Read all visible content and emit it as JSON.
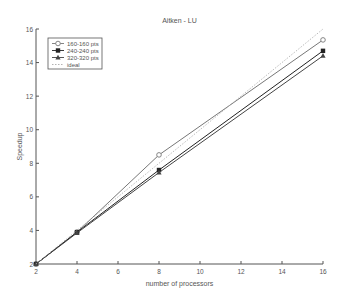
{
  "chart_data": {
    "type": "line",
    "title": "Aitken - LU",
    "xlabel": "number of processors",
    "ylabel": "Speedup",
    "xlim": [
      2,
      16
    ],
    "ylim": [
      2,
      16
    ],
    "xticks": [
      2,
      4,
      6,
      8,
      10,
      12,
      14,
      16
    ],
    "yticks": [
      2,
      4,
      6,
      8,
      10,
      12,
      14,
      16
    ],
    "grid": false,
    "legend_position": "upper left",
    "x": [
      2,
      4,
      8,
      16
    ],
    "series": [
      {
        "name": "160-160 pts",
        "marker": "circle",
        "color": "#777777",
        "values": [
          2,
          3.9,
          8.5,
          15.35
        ]
      },
      {
        "name": "240-240 pts",
        "marker": "star",
        "color": "#222222",
        "values": [
          2,
          3.9,
          7.6,
          14.7
        ]
      },
      {
        "name": "320-320 pts",
        "marker": "triangle",
        "color": "#444444",
        "values": [
          2,
          3.85,
          7.45,
          14.4
        ]
      },
      {
        "name": "ideal",
        "marker": "none",
        "style": "dotted",
        "color": "#aaaaaa",
        "values": [
          2,
          4,
          8,
          16
        ]
      }
    ]
  }
}
